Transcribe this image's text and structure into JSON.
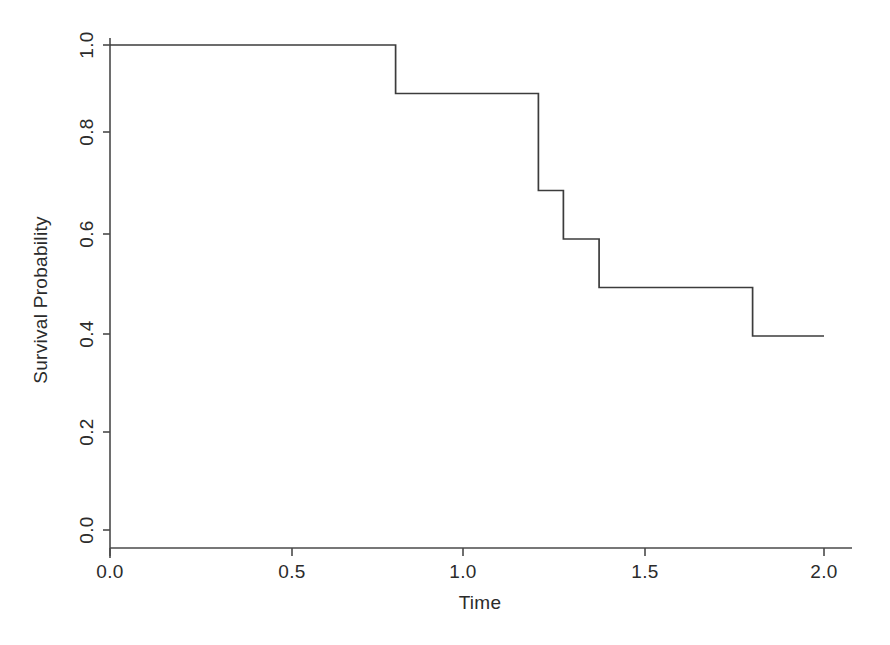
{
  "chart_data": {
    "type": "line",
    "subtype": "step-post",
    "title": "",
    "xlabel": "Time",
    "ylabel": "Survival Probability",
    "xlim": [
      0.0,
      2.0
    ],
    "ylim": [
      0.0,
      1.0
    ],
    "grid": false,
    "legend": null,
    "xticks": [
      0.0,
      0.5,
      1.0,
      1.5,
      2.0
    ],
    "xtick_labels": [
      "0.0",
      "0.5",
      "1.0",
      "1.5",
      "2.0"
    ],
    "yticks": [
      0.0,
      0.2,
      0.4,
      0.6,
      0.8,
      1.0
    ],
    "ytick_labels": [
      "0.0",
      "0.2",
      "0.4",
      "0.6",
      "0.8",
      "1.0"
    ],
    "line_color": "#3c3c3c",
    "axis_color": "#4a4a4a",
    "background_color": "#ffffff",
    "x": [
      0.0,
      0.8,
      0.8,
      1.2,
      1.2,
      1.27,
      1.27,
      1.37,
      1.37,
      1.8,
      1.8,
      2.0
    ],
    "y": [
      1.0,
      1.0,
      0.9,
      0.9,
      0.7,
      0.7,
      0.6,
      0.6,
      0.5,
      0.5,
      0.4,
      0.4
    ],
    "event_times": [
      0.8,
      1.2,
      1.3,
      1.4,
      1.8
    ],
    "survival_values": [
      0.9,
      0.7,
      0.6,
      0.5,
      0.4
    ],
    "series": [
      {
        "name": "Survival Probability",
        "x": [
          0.0,
          0.8,
          1.2,
          1.3,
          1.4,
          1.8,
          2.0
        ],
        "values": [
          1.0,
          0.9,
          0.7,
          0.6,
          0.5,
          0.4,
          0.4
        ]
      }
    ]
  },
  "figure": {
    "xlabel": "Time",
    "ylabel": "Survival Probability"
  },
  "ticks": {
    "x": [
      "0.0",
      "0.5",
      "1.0",
      "1.5",
      "2.0"
    ],
    "y": [
      "0.0",
      "0.2",
      "0.4",
      "0.6",
      "0.8",
      "1.0"
    ]
  }
}
